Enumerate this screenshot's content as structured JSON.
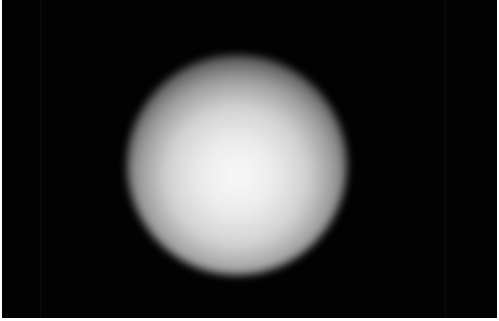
{
  "image": {
    "description": "Blurred bright white circular glow centered on a black background",
    "background_color": "#020202",
    "glow_color": "#f8f8f8",
    "border_color": "#ffffff"
  }
}
